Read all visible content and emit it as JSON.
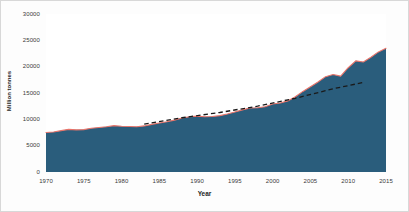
{
  "chart_data": {
    "type": "area",
    "title": "",
    "xlabel": "Year",
    "ylabel": "Million tonnes",
    "xlim": [
      1970,
      2015
    ],
    "ylim": [
      0,
      30000
    ],
    "grid": false,
    "legend": null,
    "x_ticks": [
      "1970",
      "1975",
      "1980",
      "1985",
      "1990",
      "1995",
      "2000",
      "2005",
      "2010",
      "2015"
    ],
    "y_ticks": [
      "0",
      "5000",
      "10000",
      "15000",
      "20000",
      "25000",
      "30000"
    ],
    "colors": {
      "area_fill": "#2a5d7c",
      "outline": "#e8746a",
      "trend_dashed": "#1a1a1a",
      "plot_background": "#ffffff",
      "text": "#3a3a3a"
    },
    "series": [
      {
        "name": "Material extraction",
        "style": "area-with-outline",
        "x": [
          1970,
          1971,
          1972,
          1973,
          1974,
          1975,
          1976,
          1977,
          1978,
          1979,
          1980,
          1981,
          1982,
          1983,
          1984,
          1985,
          1986,
          1987,
          1988,
          1989,
          1990,
          1991,
          1992,
          1993,
          1994,
          1995,
          1996,
          1997,
          1998,
          1999,
          2000,
          2001,
          2002,
          2003,
          2004,
          2005,
          2006,
          2007,
          2008,
          2009,
          2010,
          2011,
          2012,
          2013,
          2014,
          2015
        ],
        "values": [
          7500,
          7600,
          7850,
          8100,
          8000,
          8050,
          8300,
          8450,
          8600,
          8800,
          8700,
          8650,
          8600,
          8750,
          9050,
          9300,
          9550,
          9850,
          10250,
          10500,
          10600,
          10500,
          10550,
          10700,
          11000,
          11400,
          11800,
          12150,
          12200,
          12400,
          12900,
          13100,
          13500,
          14300,
          15300,
          16200,
          17100,
          18100,
          18500,
          18200,
          19800,
          21100,
          20900,
          21800,
          22800,
          23500
        ]
      },
      {
        "name": "Trend",
        "style": "dashed-line",
        "x": [
          1983,
          1988,
          1993,
          1998,
          2003,
          2008,
          2012
        ],
        "values": [
          9100,
          10300,
          11300,
          12500,
          14000,
          15800,
          17000
        ]
      }
    ]
  },
  "axis": {
    "y_title": "Million tonnes",
    "x_title": "Year"
  }
}
